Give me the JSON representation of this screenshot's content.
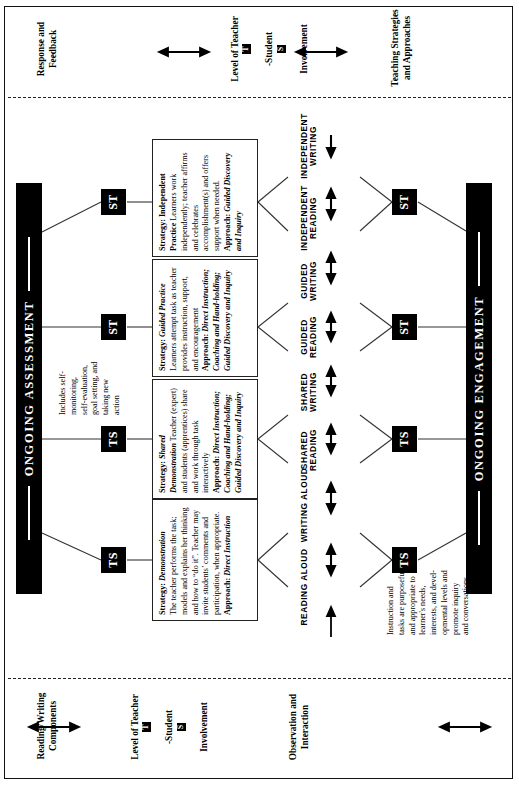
{
  "figure": {
    "title_top_banner": "ONGOING ASSESSMENT",
    "title_bottom_banner": "ONGOING ENGAGEMENT"
  },
  "columns": {
    "observation_interaction": "Observation and\nInteraction",
    "level_left_pre": "Level of Teacher",
    "level_left_badge1": "T",
    "level_left_mid": "-Student",
    "level_left_badge2": "S",
    "level_left_post": "Involvement",
    "reading_writing_components": "Reading/Writing\nComponents",
    "teaching_strategies": "Teaching Strategies\nand Approaches",
    "level_right_pre": "Level of Teacher",
    "level_right_badge1": "T",
    "level_right_mid": "-Student",
    "level_right_badge2": "S",
    "level_right_post": "Involvement",
    "response_feedback": "Response and\nFeedback"
  },
  "notes": {
    "assessment_note": "Includes self-\nmonitoring,\nself-evaluation,\ngoal setting, and\ntaking new\naction",
    "engagement_note": "Instruction and\ntasks are purposeful\nand appropriate to\nlearner's needs,\ninterests, and devel-\nopmental levels and\npromote inquiry\nand conversations"
  },
  "badges": {
    "top": [
      "TS",
      "TS",
      "ST",
      "ST"
    ],
    "bottom": [
      "TS",
      "TS",
      "ST",
      "ST"
    ]
  },
  "components": [
    "READING ALOUD",
    "WRITING ALOUD",
    "SHARED\nREADING",
    "SHARED\nWRITING",
    "GUIDED\nREADING",
    "GUIDED\nWRITING",
    "INDEPENDENT\nREADING",
    "INDEPENDENT\nWRITING"
  ],
  "strategies": [
    {
      "id": "demonstration",
      "label_strategy": "Strategy:",
      "name": "Demonstration",
      "body": "The teacher performs the task; models and explains her thinking and how to “do it”. Teacher may invite students’ comments and participation, when appropriate.",
      "label_approach": "Approach:",
      "approach": "Direct Instruction"
    },
    {
      "id": "shared-demonstration",
      "label_strategy": "Strategy:",
      "name": "Shared Demonstration",
      "body": "Teacher (expert) and students (apprentices) share and work through task interactively",
      "label_approach": "Approach:",
      "approach": "Direct Instruction; Coaching and Hand-holding; Guided Discovery and Inquiry"
    },
    {
      "id": "guided-practice",
      "label_strategy": "Strategy:",
      "name": "Guided Practice",
      "body": "Learners attempt task as teacher provides instruction, support, and encouragement",
      "label_approach": "Approach:",
      "approach": "Direct Instruction; Coaching and Hand-holding; Guided Discovery and Inquiry"
    },
    {
      "id": "independent-practice",
      "label_strategy": "Strategy:",
      "name": "Independent Practice",
      "body": "Learners work independently; teacher affirms and celebrates accomplishment(s) and offers support when needed.",
      "label_approach": "Approach:",
      "approach": "Guided Discovery and Inquiry"
    }
  ],
  "colors": {
    "ink": "#000000",
    "banner_bg": "#000000",
    "banner_fg": "#ffffff",
    "box_border": "#222222",
    "page_bg": "#ffffff"
  }
}
